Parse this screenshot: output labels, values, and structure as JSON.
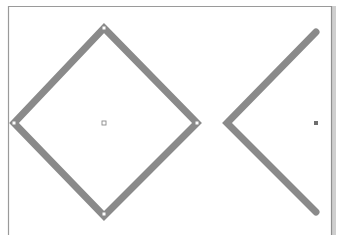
{
  "canvas": {
    "width": 340,
    "height": 235,
    "background": "#ffffff",
    "frame": {
      "border_color": "#9a9a9a",
      "shadow_color": "#c8c8c8",
      "left_x": 8,
      "top_y": 6,
      "right_x": 331
    }
  },
  "shapes": [
    {
      "type": "diamond",
      "stroke": "#8a8a8a",
      "stroke_width": 7,
      "points": [
        [
          104,
          28
        ],
        [
          197,
          123
        ],
        [
          104,
          216
        ],
        [
          14,
          123
        ]
      ],
      "vertex_handles": true,
      "center_marker": {
        "x": 104,
        "y": 123,
        "style": "hollow-square"
      }
    },
    {
      "type": "chevron-left",
      "stroke": "#8a8a8a",
      "stroke_width": 7,
      "points": [
        [
          316,
          32
        ],
        [
          227,
          123
        ],
        [
          316,
          212
        ]
      ],
      "center_marker": {
        "x": 316,
        "y": 123,
        "style": "filled-square"
      }
    }
  ]
}
